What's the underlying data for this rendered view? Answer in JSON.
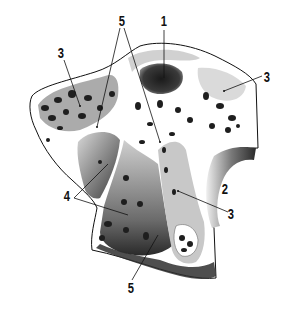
{
  "figure": {
    "type": "anatomical-section-illustration",
    "colors": {
      "ink": "#111111",
      "bone": "#ffffff",
      "shadow": "#2a2a2a",
      "mid": "#8a8a8a"
    }
  },
  "labels": [
    {
      "id": "1",
      "text": "1",
      "x": 160,
      "y": 17
    },
    {
      "id": "2",
      "text": "2",
      "x": 223,
      "y": 183
    },
    {
      "id": "3a",
      "text": "3",
      "x": 58,
      "y": 47
    },
    {
      "id": "3b",
      "text": "3",
      "x": 265,
      "y": 70
    },
    {
      "id": "3c",
      "text": "3",
      "x": 227,
      "y": 209
    },
    {
      "id": "4",
      "text": "4",
      "x": 64,
      "y": 188
    },
    {
      "id": "5a",
      "text": "5",
      "x": 118,
      "y": 14
    },
    {
      "id": "5b",
      "text": "5",
      "x": 127,
      "y": 283
    }
  ]
}
